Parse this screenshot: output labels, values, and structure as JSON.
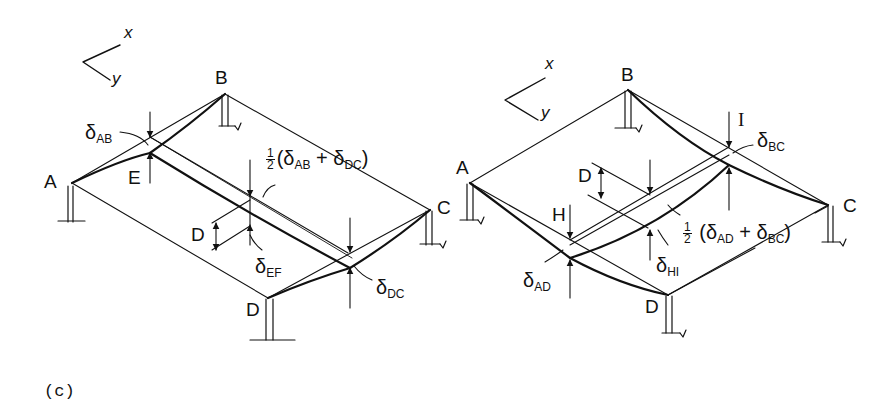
{
  "figure": {
    "caption": "(c)",
    "line_color": "#111111",
    "background": "#ffffff"
  },
  "left_panel": {
    "axes": {
      "x": "x",
      "y": "y"
    },
    "corners": {
      "A": "A",
      "B": "B",
      "C": "C",
      "D": "D"
    },
    "points": {
      "E": "E"
    },
    "dim_label": "D",
    "labels": {
      "delta_ab": {
        "sym": "δ",
        "sub": "AB"
      },
      "delta_ef": {
        "sym": "δ",
        "sub": "EF"
      },
      "delta_dc": {
        "sym": "δ",
        "sub": "DC"
      },
      "half_num": "1",
      "half_den": "2",
      "avg_open": "(δ",
      "avg_sub1": "AB",
      "avg_plus": " + δ",
      "avg_sub2": "DC",
      "avg_close": ")"
    }
  },
  "right_panel": {
    "axes": {
      "x": "x",
      "y": "y"
    },
    "corners": {
      "A": "A",
      "B": "B",
      "C": "C",
      "D": "D"
    },
    "points": {
      "H": "H",
      "I": "I"
    },
    "dim_label": "D",
    "labels": {
      "delta_bc": {
        "sym": "δ",
        "sub": "BC"
      },
      "delta_ad": {
        "sym": "δ",
        "sub": "AD"
      },
      "delta_hi": {
        "sym": "δ",
        "sub": "HI"
      },
      "half_num": "1",
      "half_den": "2",
      "avg_open": "(δ",
      "avg_sub1": "AD",
      "avg_plus": " + δ",
      "avg_sub2": "BC",
      "avg_close": ")"
    }
  }
}
